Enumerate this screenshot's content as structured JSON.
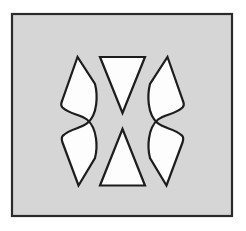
{
  "figure": {
    "title": "Figure-ground reversal illusion",
    "canvas": {
      "width": 246,
      "height": 231,
      "page_background": "#ffffff"
    },
    "panel": {
      "name": "gray-square-panel",
      "x": 12,
      "y": 14,
      "width": 220,
      "height": 202,
      "fill": "#d6d6d6",
      "stroke": "#2b2b2b",
      "stroke_width": 2.2
    },
    "shapes": [
      {
        "id": "left-bracket",
        "label": "Left bracket lens shape",
        "fill": "#fdfdfd",
        "stroke": "#1d1d1d",
        "stroke_width": 2.2,
        "path": "M 77.5 57 L 62 101 C 61 103.5 61 106 62.5 107.5 C 70 114.5 80 114 87 119.5 C 93 124.5 95 131 96 138.5 C 97 145 96.5 152 95 158 L 78.5 185.5 L 62.5 142.5 C 61.5 139.8 61.5 137.3 63 135.6 C 70.5 128.4 80.3 128.9 87.3 123.2 C 93.3 118.2 95.3 111.6 96.2 104.1 C 97 97.4 96.6 90.2 95 84 Z"
      },
      {
        "id": "right-bracket",
        "label": "Right bracket lens shape (mirror of left)",
        "fill": "#fdfdfd",
        "stroke": "#1d1d1d",
        "stroke_width": 2.2,
        "path": "M 167.5 57 L 183 101 C 184 103.5 184 106 182.5 107.5 C 175 114.5 165 114 158 119.5 C 152 124.5 150 131 149 138.5 C 148 145 148.5 152 150 158 L 166.5 185.5 L 182.5 142.5 C 183.5 139.8 183.5 137.3 182 135.6 C 174.5 128.4 164.7 128.9 157.7 123.2 C 151.7 118.2 149.7 111.6 148.8 104.1 C 148 97.4 148.4 90.2 150 84 Z"
      },
      {
        "id": "top-triangle",
        "label": "Downward-pointing triangle (top center)",
        "fill": "#fdfdfd",
        "stroke": "#1d1d1d",
        "stroke_width": 2.2,
        "path": "M 100 57 L 145 57 L 122.5 113 Z"
      },
      {
        "id": "bottom-triangle",
        "label": "Upward-pointing triangle (bottom center)",
        "fill": "#fdfdfd",
        "stroke": "#1d1d1d",
        "stroke_width": 2.2,
        "path": "M 122.5 129 L 145 185.5 L 100 185.5 Z"
      }
    ],
    "colors": {
      "panel_gray": "#d6d6d6",
      "shape_white": "#fdfdfd",
      "outline_dark": "#1d1d1d",
      "page_white": "#ffffff"
    }
  }
}
